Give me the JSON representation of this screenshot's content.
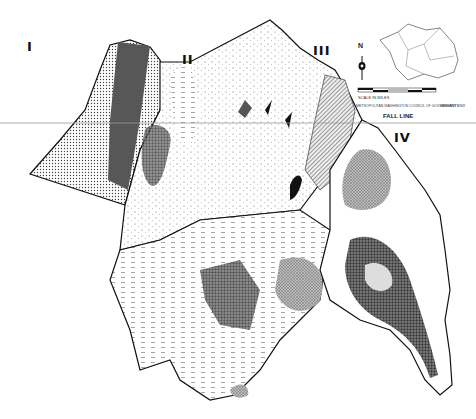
{
  "map": {
    "type": "geologic / physiographic province map (scanned, monochrome)",
    "regions": [
      {
        "id": "I",
        "label": "I"
      },
      {
        "id": "II",
        "label": "II"
      },
      {
        "id": "III",
        "label": "III"
      },
      {
        "id": "IV",
        "label": "IV"
      }
    ],
    "annotations": {
      "fall_line": "FALL LINE"
    },
    "north_arrow": {
      "letter": "N"
    },
    "scale_bar": {
      "label": "SCALE IN MILES"
    },
    "credit_line": "METROPOLITAN WASHINGTON COUNCIL OF GOVERNMENTS",
    "credit_date": "JANUARY 1968",
    "colors": {
      "paper": "#ffffff",
      "ink": "#111111",
      "dark_fill": "#3a3a3a",
      "mid_fill": "#8a8a8a",
      "light_fill": "#c8c8c8",
      "guide_line": "#9a9a9a"
    }
  }
}
